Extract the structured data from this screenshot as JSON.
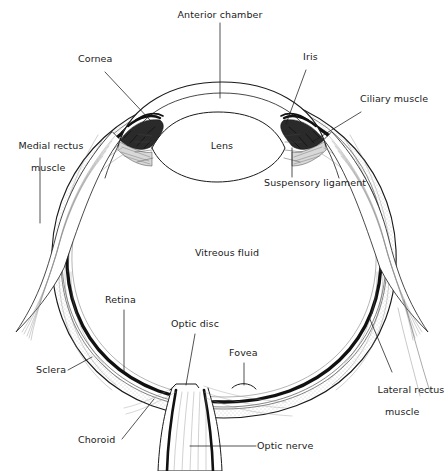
{
  "figure": {
    "background_color": "#ffffff",
    "ink_color": "#1a1a1a",
    "width": 445,
    "height": 471
  },
  "labels": {
    "anterior_chamber": "Anterior chamber",
    "cornea": "Cornea",
    "iris": "Iris",
    "ciliary_muscle": "Ciliary muscle",
    "medial_rectus_muscle": "Medial rectus\nmuscle",
    "medial_rectus_muscle_line1": "Medial rectus",
    "medial_rectus_muscle_line2": "muscle",
    "lens": "Lens",
    "suspensory_ligament": "Suspensory ligament",
    "vitreous_fluid": "Vitreous fluid",
    "retina": "Retina",
    "sclera": "Sclera",
    "choroid": "Choroid",
    "optic_disc": "Optic disc",
    "fovea": "Fovea",
    "optic_nerve": "Optic nerve",
    "lateral_rectus_muscle_line1": "Lateral rectus",
    "lateral_rectus_muscle_line2": "muscle"
  },
  "structures": [
    {
      "name": "sclera",
      "description": "outer white fibrous coat of the eyeball"
    },
    {
      "name": "choroid",
      "description": "pigmented vascular layer beneath the sclera"
    },
    {
      "name": "retina",
      "description": "inner light-sensitive layer, drawn as a heavy black line"
    },
    {
      "name": "cornea",
      "description": "transparent anterior dome, two concentric arcs"
    },
    {
      "name": "anterior-chamber",
      "description": "space between cornea and lens"
    },
    {
      "name": "iris",
      "description": "dark stippled diaphragm anterior to the lens"
    },
    {
      "name": "lens",
      "description": "biconvex transparent body behind the iris"
    },
    {
      "name": "ciliary-muscle",
      "description": "muscular ring attached to the suspensory ligament"
    },
    {
      "name": "suspensory-ligament",
      "description": "zonular fibres suspending the lens"
    },
    {
      "name": "vitreous-fluid",
      "description": "gel filling the posterior chamber"
    },
    {
      "name": "optic-disc",
      "description": "blind spot where the optic nerve leaves the eye"
    },
    {
      "name": "fovea",
      "description": "small depression of sharpest vision"
    },
    {
      "name": "optic-nerve",
      "description": "nerve fibre bundle exiting posteriorly"
    },
    {
      "name": "medial-rectus-muscle",
      "description": "extraocular muscle on the nasal side"
    },
    {
      "name": "lateral-rectus-muscle",
      "description": "extraocular muscle on the temporal side"
    }
  ],
  "leader_lines": [
    {
      "for": "anterior-chamber",
      "from": [
        220,
        23
      ],
      "to": [
        220,
        98
      ],
      "style": "vertical"
    },
    {
      "for": "cornea",
      "from": [
        105,
        72
      ],
      "to": [
        148,
        118
      ],
      "style": "diagonal"
    },
    {
      "for": "iris",
      "from": [
        305,
        70
      ],
      "to": [
        283,
        120
      ],
      "style": "diagonal"
    },
    {
      "for": "ciliary-muscle",
      "from": [
        362,
        112
      ],
      "to": [
        312,
        140
      ],
      "style": "diagonal"
    },
    {
      "for": "medial-rectus-muscle",
      "from": [
        40,
        157
      ],
      "to": [
        40,
        222
      ],
      "style": "vertical"
    },
    {
      "for": "suspensory-ligament",
      "from": [
        292,
        178
      ],
      "to": [
        292,
        148
      ],
      "style": "vertical"
    },
    {
      "for": "retina",
      "from": [
        124,
        310
      ],
      "to": [
        124,
        372
      ],
      "style": "vertical"
    },
    {
      "for": "sclera",
      "from": [
        68,
        371
      ],
      "to": [
        92,
        358
      ],
      "style": "diagonal"
    },
    {
      "for": "choroid",
      "from": [
        122,
        440
      ],
      "to": [
        152,
        400
      ],
      "style": "diagonal"
    },
    {
      "for": "optic-disc",
      "from": [
        194,
        334
      ],
      "to": [
        186,
        384
      ],
      "style": "diagonal"
    },
    {
      "for": "fovea",
      "from": [
        244,
        363
      ],
      "to": [
        244,
        384
      ],
      "style": "vertical"
    },
    {
      "for": "optic-nerve",
      "from": [
        255,
        446
      ],
      "to": [
        192,
        446
      ],
      "style": "horizontal"
    },
    {
      "for": "lateral-rectus-muscle",
      "from": [
        392,
        372
      ],
      "to": [
        368,
        318
      ],
      "style": "diagonal"
    }
  ]
}
